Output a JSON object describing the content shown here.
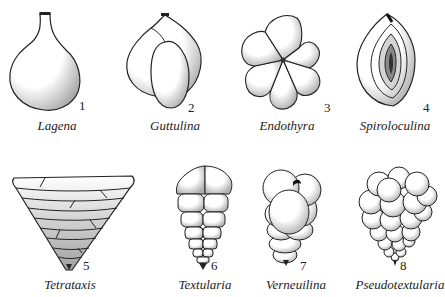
{
  "figure": {
    "type": "foraminifera-test-morphology-plate",
    "specimens": [
      {
        "number": "1",
        "name": "Lagena"
      },
      {
        "number": "2",
        "name": "Guttulina"
      },
      {
        "number": "3",
        "name": "Endothyra"
      },
      {
        "number": "4",
        "name": "Spiroloculina"
      },
      {
        "number": "5",
        "name": "Tetrataxis"
      },
      {
        "number": "6",
        "name": "Textularia"
      },
      {
        "number": "7",
        "name": "Verneuilina"
      },
      {
        "number": "8",
        "name": "Pseudotextularia"
      }
    ],
    "colors": {
      "ink": "#222222",
      "stipple": "#9a9a9a",
      "background": "#ffffff"
    }
  }
}
